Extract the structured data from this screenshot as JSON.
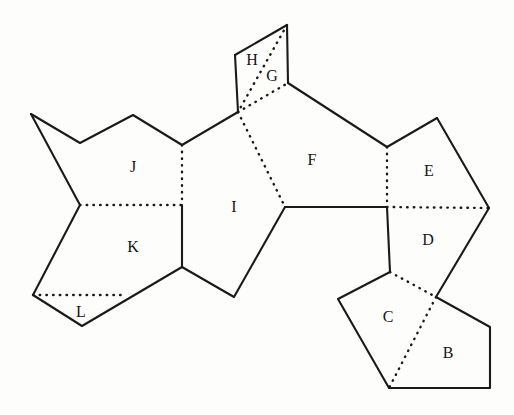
{
  "figure": {
    "type": "polygon-net-unfolding",
    "width": 514,
    "height": 415,
    "background_color": "#fdfdfc",
    "line_color": "#1a1a1a",
    "solid_edge_meaning": "boundary edge",
    "dotted_edge_meaning": "fold / internal edge"
  },
  "labels": [
    {
      "id": "B",
      "text": "B",
      "x": 448,
      "y": 354
    },
    {
      "id": "C",
      "text": "C",
      "x": 388,
      "y": 318
    },
    {
      "id": "D",
      "text": "D",
      "x": 428,
      "y": 241
    },
    {
      "id": "E",
      "text": "E",
      "x": 429,
      "y": 172
    },
    {
      "id": "F",
      "text": "F",
      "x": 312,
      "y": 161
    },
    {
      "id": "G",
      "text": "G",
      "x": 272,
      "y": 77
    },
    {
      "id": "H",
      "text": "H",
      "x": 252,
      "y": 61
    },
    {
      "id": "I",
      "text": "I",
      "x": 234,
      "y": 208
    },
    {
      "id": "J",
      "text": "J",
      "x": 133,
      "y": 168
    },
    {
      "id": "K",
      "text": "K",
      "x": 133,
      "y": 248
    },
    {
      "id": "L",
      "text": "L",
      "x": 81,
      "y": 313
    }
  ],
  "solid_paths": [
    {
      "id": "outline-top-left",
      "d": "M 31 114 L 80 143 L 133 115 L 182 145 L 238 112"
    },
    {
      "id": "outline-left-down",
      "d": "M 31 114 L 80 205 L 33 295 L 82 326 L 182 267"
    },
    {
      "id": "outline-parallelogram-left",
      "d": "M 235 55 L 238 112"
    },
    {
      "id": "outline-parallelogram-top",
      "d": "M 235 55 L 287 25"
    },
    {
      "id": "outline-parallelogram-right",
      "d": "M 287 25 L 288 83"
    },
    {
      "id": "edge-g-to-f",
      "d": "M 288 83 L 387 147"
    },
    {
      "id": "edge-f-to-e-peak",
      "d": "M 387 147 L 437 118"
    },
    {
      "id": "edge-e-peak-to-right",
      "d": "M 437 118 L 489 208"
    },
    {
      "id": "edge-e-right-to-d",
      "d": "M 489 208 L 436 297"
    },
    {
      "id": "edge-d-to-b-right",
      "d": "M 436 297 L 490 327 L 490 388 L 389 388"
    },
    {
      "id": "edge-c-bottom-left",
      "d": "M 389 388 L 338 299 L 390 272"
    },
    {
      "id": "edge-c-top-to-d-bottom",
      "d": "M 390 272 L 387 207"
    },
    {
      "id": "edge-i-f-horizontal",
      "d": "M 285 207 L 387 207"
    },
    {
      "id": "edge-i-right-down",
      "d": "M 285 207 L 234 297 L 182 267"
    },
    {
      "id": "edge-j-k-vertical-solid",
      "d": "M 182 205 L 182 267"
    }
  ],
  "dotted_paths": [
    {
      "id": "fold-h-g-diagonal",
      "d": "M 287 25 L 238 112"
    },
    {
      "id": "fold-g-bottom",
      "d": "M 238 112 L 288 83"
    },
    {
      "id": "fold-i-f",
      "d": "M 238 112 L 285 207"
    },
    {
      "id": "fold-j-i-vertical",
      "d": "M 182 145 L 182 205"
    },
    {
      "id": "fold-j-k-horizontal",
      "d": "M 80 205 L 182 205"
    },
    {
      "id": "fold-k-l-horizontal",
      "d": "M 33 295 L 125 295"
    },
    {
      "id": "fold-f-e-vertical",
      "d": "M 387 147 L 387 207"
    },
    {
      "id": "fold-e-d-horizontal",
      "d": "M 387 207 L 489 208"
    },
    {
      "id": "fold-c-d",
      "d": "M 390 272 L 436 297"
    },
    {
      "id": "fold-c-b",
      "d": "M 436 297 L 389 388"
    }
  ]
}
